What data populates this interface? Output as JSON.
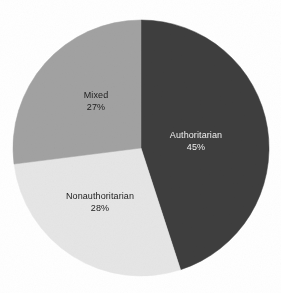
{
  "figure": {
    "background_color": "#ffffff",
    "width": 281,
    "height": 293
  },
  "chart_data": {
    "type": "pie",
    "title": "",
    "subtitle": "",
    "xlabel": "",
    "ylabel": "",
    "grid": false,
    "legend": "none",
    "label_position": "inside-slices",
    "start_angle_deg": 0,
    "direction": "clockwise",
    "units": "percent",
    "categories": [
      "Authoritarian",
      "Nonauthoritarian",
      "Mixed"
    ],
    "values": [
      45,
      28,
      27
    ],
    "value_labels": [
      "45%",
      "28%",
      "27%"
    ],
    "colors": [
      "#3e3e3e",
      "#e6e6e6",
      "#a2a2a2"
    ],
    "slices": [
      {
        "name": "Authoritarian",
        "value": 45,
        "value_label": "45%",
        "color": "#3e3e3e",
        "text_color": "#f2f2f2",
        "start_angle_deg": 0,
        "end_angle_deg": 162
      },
      {
        "name": "Nonauthoritarian",
        "value": 28,
        "value_label": "28%",
        "color": "#e6e6e6",
        "text_color": "#1c1c1c",
        "start_angle_deg": 162,
        "end_angle_deg": 262.8
      },
      {
        "name": "Mixed",
        "value": 27,
        "value_label": "27%",
        "color": "#a2a2a2",
        "text_color": "#1c1c1c",
        "start_angle_deg": 262.8,
        "end_angle_deg": 360
      }
    ],
    "geometry": {
      "center_x": 141,
      "center_y": 148,
      "radius": 128
    }
  }
}
